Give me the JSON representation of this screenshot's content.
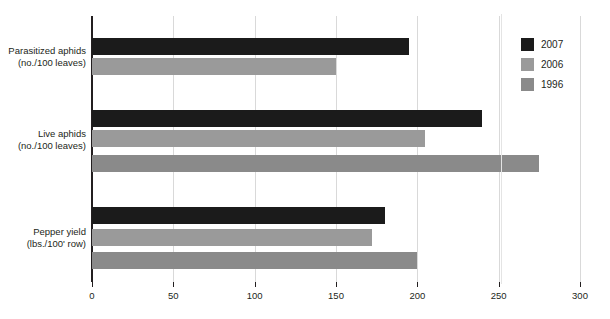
{
  "chart_data": {
    "type": "bar",
    "orientation": "horizontal",
    "title": "",
    "xlabel": "",
    "ylabel": "",
    "xlim": [
      0,
      300
    ],
    "xticks": [
      0,
      50,
      100,
      150,
      200,
      250,
      300
    ],
    "grid": true,
    "legend_position": "right",
    "categories": [
      "Parasitized aphids\n(no./100 leaves)",
      "Live aphids\n(no./100 leaves)",
      "Pepper yield\n(lbs./100' row)"
    ],
    "category_lines": [
      {
        "line1": "Parasitized aphids",
        "line2": "(no./100 leaves)"
      },
      {
        "line1": "Live aphids",
        "line2": "(no./100 leaves)"
      },
      {
        "line1": "Pepper yield",
        "line2": "(lbs./100' row)"
      }
    ],
    "series": [
      {
        "name": "2007",
        "color": "#1b1b1b",
        "values": [
          195,
          240,
          180
        ]
      },
      {
        "name": "2006",
        "color": "#9a9a9a",
        "values": [
          150,
          205,
          172
        ]
      },
      {
        "name": "1996",
        "color": "#8a8a8a",
        "values": [
          null,
          275,
          200
        ]
      }
    ],
    "bars": [
      {
        "group": 0,
        "series": "2007",
        "value": 195,
        "color": "#1b1b1b",
        "top": 38
      },
      {
        "group": 0,
        "series": "2006",
        "value": 150,
        "color": "#9a9a9a",
        "top": 58
      },
      {
        "group": 1,
        "series": "2007",
        "value": 240,
        "color": "#1b1b1b",
        "top": 110
      },
      {
        "group": 1,
        "series": "2006",
        "value": 205,
        "color": "#9a9a9a",
        "top": 130
      },
      {
        "group": 1,
        "series": "1996",
        "value": 275,
        "color": "#8a8a8a",
        "top": 155
      },
      {
        "group": 2,
        "series": "2007",
        "value": 180,
        "color": "#1b1b1b",
        "top": 207
      },
      {
        "group": 2,
        "series": "2006",
        "value": 172,
        "color": "#9a9a9a",
        "top": 229
      },
      {
        "group": 2,
        "series": "1996",
        "value": 200,
        "color": "#8a8a8a",
        "top": 252
      }
    ]
  },
  "legend": {
    "items": [
      {
        "label": "2007",
        "color": "#1b1b1b"
      },
      {
        "label": "2006",
        "color": "#9a9a9a"
      },
      {
        "label": "1996",
        "color": "#8a8a8a"
      }
    ]
  },
  "axis": {
    "tick_labels": [
      "0",
      "50",
      "100",
      "150",
      "200",
      "250",
      "300"
    ]
  },
  "caption": {
    "text": ""
  },
  "colors": {
    "series_2007": "#1b1b1b",
    "series_2006": "#9a9a9a",
    "series_1996": "#8a8a8a",
    "axis": "#231f20",
    "grid": "#d9d9d9",
    "background": "#ffffff"
  }
}
